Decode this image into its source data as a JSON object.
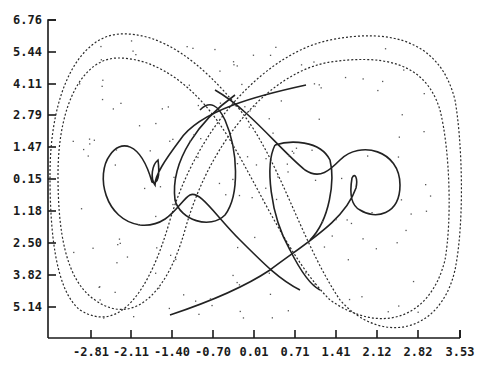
{
  "chart_data": {
    "type": "line",
    "title": "",
    "xlabel": "",
    "ylabel": "",
    "x_ticks": [
      "-2.81",
      "-2.11",
      "-1.40",
      "-0.70",
      "0.01",
      "0.71",
      "1.41",
      "2.12",
      "2.82",
      "3.53"
    ],
    "y_ticks": [
      "6.76",
      "5.44",
      "4.11",
      "2.79",
      "1.47",
      "0.15",
      "1.18",
      "2.50",
      "3.82",
      "5.14"
    ],
    "xlim": [
      -3.5,
      3.53
    ],
    "ylim": [
      -6.5,
      6.76
    ],
    "grid": false,
    "legend": null,
    "series": [
      {
        "name": "outer figure-eight orbit (dashed, outer)",
        "style": "dotted"
      },
      {
        "name": "outer figure-eight orbit (dashed, inner)",
        "style": "dotted"
      },
      {
        "name": "left looped trajectory",
        "style": "solid"
      },
      {
        "name": "right looped trajectory",
        "style": "solid"
      },
      {
        "name": "scattered points",
        "style": "scatter"
      }
    ]
  },
  "axes": {
    "x_tick_px": [
      91,
      131,
      172,
      213,
      254,
      295,
      336,
      377,
      418,
      460
    ],
    "y_tick_px": [
      20,
      52,
      84,
      115,
      147,
      179,
      211,
      243,
      275,
      307
    ]
  }
}
